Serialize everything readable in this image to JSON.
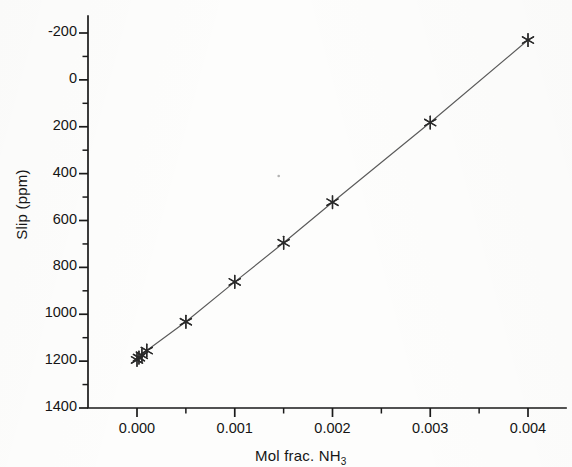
{
  "figure": {
    "background_color": "#fdfdfc",
    "ink_color": "#1a1a1a",
    "line_color": "#5a5a5a",
    "marker_color": "#2a2a2a"
  },
  "axis_titles": {
    "y": "Slip (ppm)",
    "x_main": "Mol frac. NH",
    "x_sub": "3"
  },
  "y_ticks": [
    {
      "value": 1400,
      "label": "1400"
    },
    {
      "value": 1200,
      "label": "1200"
    },
    {
      "value": 1000,
      "label": "1000"
    },
    {
      "value": 800,
      "label": "800"
    },
    {
      "value": 600,
      "label": "600"
    },
    {
      "value": 400,
      "label": "400"
    },
    {
      "value": 200,
      "label": "200"
    },
    {
      "value": 0,
      "label": "0"
    },
    {
      "value": -200,
      "label": "-200"
    }
  ],
  "x_ticks": [
    {
      "value": 0.0,
      "label": "0.000"
    },
    {
      "value": 0.001,
      "label": "0.001"
    },
    {
      "value": 0.002,
      "label": "0.002"
    },
    {
      "value": 0.003,
      "label": "0.003"
    },
    {
      "value": 0.004,
      "label": "0.004"
    }
  ],
  "chart_data": {
    "type": "scatter",
    "title": "",
    "subtitle": "",
    "xlabel": "Mol frac. NH3",
    "ylabel": "Slip (ppm)",
    "xlim": [
      -0.00035,
      0.00455
    ],
    "ylim": [
      -200,
      1480
    ],
    "xtick_values": [
      0.0,
      0.001,
      0.002,
      0.003,
      0.004
    ],
    "ytick_values": [
      -200,
      0,
      200,
      400,
      600,
      800,
      1000,
      1200,
      1400
    ],
    "minor_ticks": true,
    "grid": false,
    "legend": null,
    "legend_position": "none",
    "marker_style": "asterisk",
    "connected_by_line": true,
    "series": [
      {
        "name": "NH3 slip calibration",
        "x": [
          0.0,
          2e-05,
          5e-05,
          0.0001,
          0.0005,
          0.001,
          0.0015,
          0.002,
          0.003,
          0.004
        ],
        "y": [
          5,
          15,
          25,
          45,
          168,
          338,
          505,
          678,
          1018,
          1370
        ]
      }
    ],
    "annotations": [
      {
        "kind": "scan-speck",
        "x": 0.00145,
        "y": 790
      }
    ]
  }
}
